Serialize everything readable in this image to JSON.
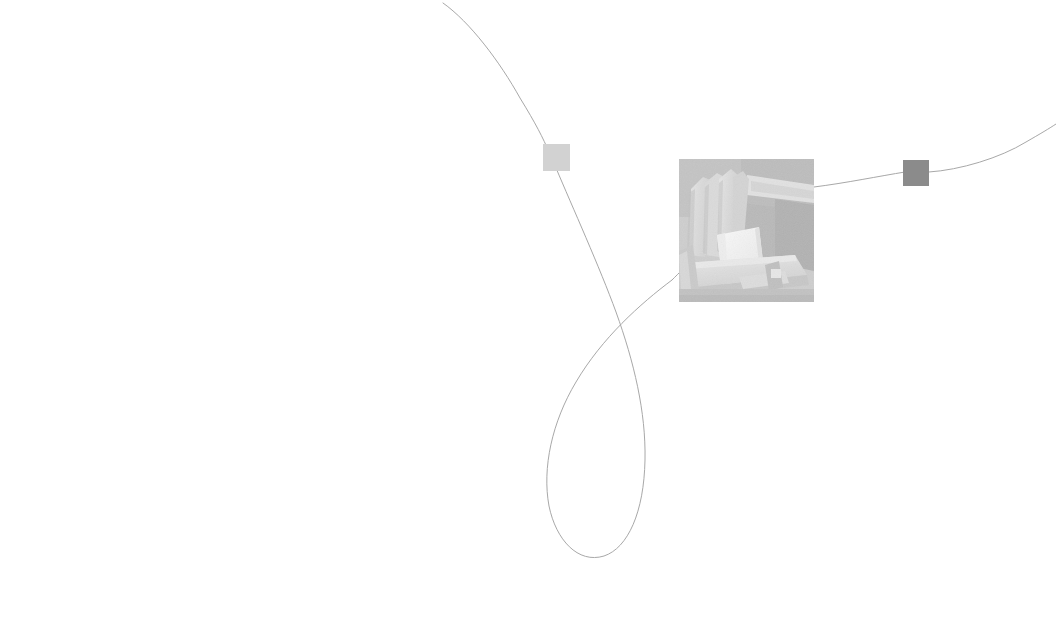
{
  "canvas": {
    "width": 1056,
    "height": 619,
    "background_color": "#ffffff",
    "title": "Node Graph Canvas"
  },
  "edges": {
    "stroke_color": "#a8a8a8",
    "stroke_width": 1,
    "paths": [
      {
        "id": "edge-top-left-to-node-a",
        "name": "edge-incoming-top",
        "d": "M 443 3 C 470 22 500 62 520 98 C 536 124 543 138 549 152"
      },
      {
        "id": "edge-node-a-to-loop",
        "name": "edge-node-a-to-loop",
        "d": "M 556 168 C 572 206 600 268 616 312 C 634 362 646 412 645 460 C 644 512 628 548 604 556 C 578 564 556 540 549 506 C 542 468 552 422 576 382 C 602 338 640 304 672 280"
      },
      {
        "id": "edge-loop-to-thumb",
        "name": "edge-loop-to-thumb",
        "d": "M 672 280 C 676 276 679 273 681 271"
      },
      {
        "id": "edge-thumb-to-node-b",
        "name": "edge-thumb-to-node-b",
        "d": "M 814 187 C 846 183 880 176 905 172"
      },
      {
        "id": "edge-node-b-to-right",
        "name": "edge-outgoing-right",
        "d": "M 929 172 C 960 170 1000 158 1026 142 C 1040 134 1050 128 1056 124"
      }
    ]
  },
  "nodes": [
    {
      "id": "node-a",
      "name": "node-square-light",
      "shape": "square",
      "x": 543,
      "y": 144,
      "width": 27,
      "height": 27,
      "fill": "#d2d2d2"
    },
    {
      "id": "node-b",
      "name": "node-square-dark",
      "shape": "square",
      "x": 903,
      "y": 160,
      "width": 26,
      "height": 26,
      "fill": "#8b8b8b"
    },
    {
      "id": "node-thumb",
      "name": "node-image-thumbnail",
      "shape": "image",
      "x": 679,
      "y": 159,
      "width": 135,
      "height": 143,
      "description": "Faded grayscale photograph of wooden Adirondack chairs with a white object on the seat",
      "dominant_color": "#b9b9b9"
    }
  ],
  "thumbnail_art": {
    "background": "#b8b8b8",
    "shadow_dark": "#9a9a9a",
    "shadow_darker": "#8d8d8d",
    "slat_light": "#cfcfcf",
    "slat_mid": "#c2c2c2",
    "seat_light": "#d6d6d6",
    "white_object": "#f2f2f2",
    "white_object_edge": "#e2e2e2",
    "ground": "#a9a9a9"
  }
}
